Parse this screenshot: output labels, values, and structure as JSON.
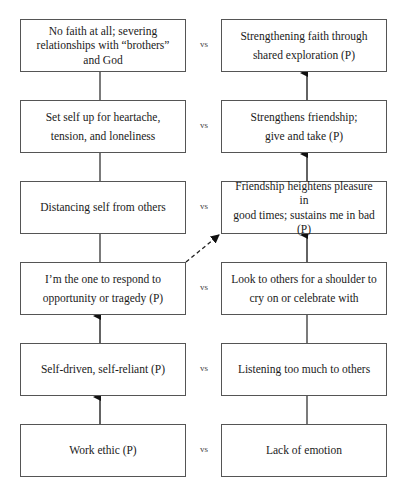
{
  "diagram": {
    "separator_label": "vs",
    "rows": [
      {
        "left": "No faith at all; severing\nrelationships with “brothers”\nand God",
        "right": "Strengthening faith through\nshared exploration (P)"
      },
      {
        "left": "Set self up for heartache,\ntension, and loneliness",
        "right": "Strengthens friendship;\ngive and take (P)"
      },
      {
        "left": "Distancing self from others",
        "right": "Friendship heightens pleasure in\ngood times; sustains me in bad\n(P)"
      },
      {
        "left": "I’m the one to respond to\nopportunity or tragedy (P)",
        "right": "Look to others for a shoulder to\ncry on or celebrate with"
      },
      {
        "left": "Self-driven, self-reliant (P)",
        "right": "Listening too much to others"
      },
      {
        "left": "Work ethic (P)",
        "right": "Lack of emotion"
      }
    ],
    "connectors": [
      {
        "from": "left-6",
        "to": "left-5",
        "style": "arrow"
      },
      {
        "from": "left-5",
        "to": "left-4",
        "style": "arrow"
      },
      {
        "from": "left-4",
        "to": "left-3",
        "style": "line"
      },
      {
        "from": "left-3",
        "to": "left-2",
        "style": "line"
      },
      {
        "from": "left-2",
        "to": "left-1",
        "style": "line"
      },
      {
        "from": "right-6",
        "to": "right-5",
        "style": "line"
      },
      {
        "from": "right-5",
        "to": "right-4",
        "style": "line"
      },
      {
        "from": "right-4",
        "to": "right-3",
        "style": "arrow"
      },
      {
        "from": "right-3",
        "to": "right-2",
        "style": "arrow"
      },
      {
        "from": "right-2",
        "to": "right-1",
        "style": "arrow"
      },
      {
        "from": "left-4",
        "to": "right-3",
        "style": "dashed-arrow"
      }
    ]
  }
}
